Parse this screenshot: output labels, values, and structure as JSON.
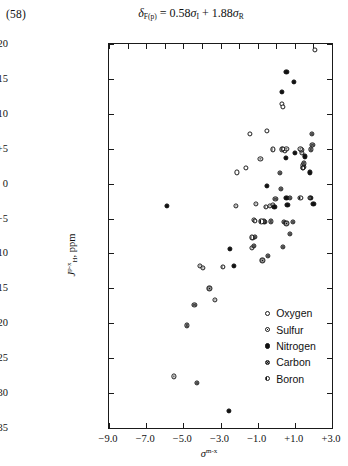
{
  "equation_number": "(58)",
  "equation": {
    "lhs_symbol": "δ",
    "lhs_sub": "F(p)",
    "equals": "=",
    "term1_coeff": "0.58",
    "term1_symbol": "σ",
    "term1_sub": "I",
    "plus": "+",
    "term2_coeff": "1.88",
    "term2_symbol": "σ",
    "term2_sub": "R",
    "plain": "δF(p) = 0.58σI + 1.88σR"
  },
  "chart_data": {
    "type": "scatter",
    "title": "",
    "xlabel": "σ m-x",
    "xlabel_symbol": "σ",
    "xlabel_sup": "m-x",
    "ylabel": "J H p-x , ppm",
    "ylabel_symbol": "J",
    "ylabel_sup": "p-x",
    "ylabel_sub": "H",
    "ylabel_unit": "ppm",
    "xlim": [
      -9.0,
      3.0
    ],
    "ylim": [
      -35,
      20
    ],
    "xticks": [
      -9.0,
      -7.0,
      -5.0,
      -3.0,
      -1.0,
      1.0,
      3.0
    ],
    "xticklabels": [
      "−9.0",
      "−7.0",
      "−5.0",
      "−3.0",
      "−1.0",
      "+1.0",
      "+3.0"
    ],
    "xminorticks": [
      -8.0,
      -6.0,
      -4.0,
      -2.0,
      0.0,
      2.0
    ],
    "yticks": [
      20,
      15,
      10,
      5,
      0,
      -5,
      -10,
      -15,
      -20,
      -25,
      -30,
      -35
    ],
    "yticklabels": [
      "+20",
      "+15",
      "+10",
      "+5",
      "0",
      "−5",
      "−10",
      "−15",
      "−20",
      "−25",
      "−30",
      "−35"
    ],
    "grid": false,
    "legend_position": "lower-right",
    "legend": [
      {
        "label": "Oxygen",
        "marker": "open-circle",
        "key": "oxygen"
      },
      {
        "label": "Sulfur",
        "marker": "dotted-circle",
        "key": "sulfur"
      },
      {
        "label": "Nitrogen",
        "marker": "filled-circle",
        "key": "nitrogen"
      },
      {
        "label": "Carbon",
        "marker": "ringed-circle",
        "key": "carbon"
      },
      {
        "label": "Boron",
        "marker": "half-filled-circle",
        "key": "boron"
      }
    ],
    "series": [
      {
        "name": "Oxygen",
        "key": "oxygen",
        "points": [
          [
            2.1,
            19.2
          ],
          [
            0.3,
            11.4
          ],
          [
            0.35,
            11.0
          ],
          [
            -1.4,
            7.1
          ],
          [
            -0.5,
            7.5
          ],
          [
            -2.1,
            1.6
          ],
          [
            -1.65,
            2.3
          ],
          [
            0.45,
            4.7
          ]
        ]
      },
      {
        "name": "Sulfur",
        "key": "sulfur",
        "points": [
          [
            0.55,
            5.0
          ],
          [
            0.3,
            4.9
          ],
          [
            1.5,
            2.4
          ],
          [
            1.45,
            2.6
          ],
          [
            1.4,
            4.4
          ],
          [
            1.35,
            4.8
          ],
          [
            1.3,
            5.0
          ],
          [
            -0.85,
            3.5
          ],
          [
            -1.1,
            -2.9
          ],
          [
            -1.2,
            -5.2
          ],
          [
            -1.25,
            -7.8
          ],
          [
            -1.3,
            -9.2
          ],
          [
            -0.35,
            -3.2
          ],
          [
            -0.2,
            -3.0
          ],
          [
            -3.3,
            -16.6
          ],
          [
            -4.1,
            -11.8
          ],
          [
            -3.95,
            -12.1
          ],
          [
            -5.5,
            -27.6
          ],
          [
            -2.15,
            -3.2
          ]
        ]
      },
      {
        "name": "Nitrogen",
        "key": "nitrogen",
        "points": [
          [
            0.55,
            16.0
          ],
          [
            0.95,
            14.6
          ],
          [
            0.3,
            13.1
          ],
          [
            1.0,
            4.4
          ],
          [
            0.5,
            3.7
          ],
          [
            1.55,
            3.9
          ],
          [
            1.8,
            1.6
          ],
          [
            -0.5,
            -0.3
          ],
          [
            0.55,
            -2.1
          ],
          [
            0.6,
            -3.0
          ],
          [
            1.85,
            -2.1
          ],
          [
            2.0,
            -2.9
          ],
          [
            -0.1,
            -3.3
          ],
          [
            -5.9,
            -3.2
          ],
          [
            -2.5,
            -9.4
          ],
          [
            -2.3,
            -11.8
          ],
          [
            -2.55,
            -32.6
          ]
        ]
      },
      {
        "name": "Carbon",
        "key": "carbon",
        "points": [
          [
            0.2,
            1.5
          ],
          [
            1.45,
            2.2
          ],
          [
            1.5,
            2.9
          ],
          [
            1.9,
            7.1
          ],
          [
            1.95,
            5.5
          ],
          [
            1.85,
            4.9
          ],
          [
            0.25,
            -0.7
          ],
          [
            -0.05,
            -2.2
          ],
          [
            0.75,
            -2.1
          ],
          [
            1.8,
            -2.1
          ],
          [
            -0.3,
            -5.4
          ],
          [
            -0.6,
            -5.5
          ],
          [
            0.4,
            -5.5
          ],
          [
            0.55,
            -5.7
          ],
          [
            0.9,
            -5.5
          ],
          [
            0.75,
            -7.2
          ],
          [
            -0.65,
            -5.4
          ],
          [
            -1.15,
            -7.6
          ],
          [
            -1.2,
            -8.9
          ],
          [
            -0.45,
            -10.3
          ],
          [
            -0.75,
            -11.0
          ],
          [
            0.35,
            -9.1
          ],
          [
            -3.6,
            -15.0
          ],
          [
            -4.4,
            -17.4
          ],
          [
            -4.8,
            -20.3
          ],
          [
            -4.25,
            -28.5
          ]
        ]
      },
      {
        "name": "Boron",
        "key": "boron",
        "points": [
          [
            0.35,
            5.0
          ],
          [
            -0.2,
            4.9
          ],
          [
            1.45,
            2.3
          ],
          [
            -0.55,
            -3.3
          ],
          [
            -1.15,
            -5.3
          ],
          [
            -1.3,
            -7.7
          ],
          [
            -2.85,
            -11.9
          ],
          [
            -0.8,
            -5.4
          ],
          [
            1.3,
            -2.0
          ]
        ]
      }
    ]
  }
}
